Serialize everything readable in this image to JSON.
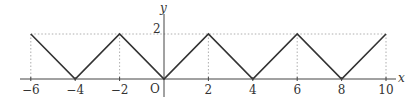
{
  "chart_data": {
    "type": "line",
    "title": "",
    "xlabel": "x",
    "ylabel": "y",
    "origin_label": "O",
    "x": [
      -6,
      -4,
      -2,
      0,
      2,
      4,
      6,
      8,
      10
    ],
    "values": [
      2,
      0,
      2,
      0,
      2,
      0,
      2,
      0,
      2
    ],
    "x_ticks": [
      "−6",
      "−4",
      "−2",
      "2",
      "4",
      "6",
      "8",
      "10"
    ],
    "y_ticks": [
      "2"
    ],
    "xlim": [
      -6.5,
      10.8
    ],
    "ylim": [
      -0.5,
      3.5
    ],
    "grid": false,
    "guide_lines": "dotted vertical lines at peaks x=-6,-2,2,6,10 and dotted horizontal line at y=2",
    "line_color": "#333333"
  }
}
